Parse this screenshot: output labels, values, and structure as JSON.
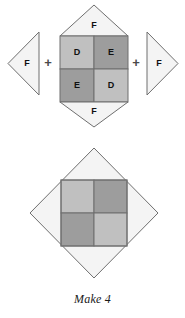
{
  "figure": {
    "caption": "Make 4",
    "background_color": "#ffffff",
    "outline_color": "#6f6f6f"
  },
  "colors": {
    "piece_f_fill": "#f4f4f4",
    "piece_d_fill": "#c0c0c0",
    "piece_e_fill": "#9d9d9d",
    "label_text": "#111111",
    "plus_text": "#4a4a4a"
  },
  "equation": {
    "operators": [
      {
        "symbol": "+",
        "name": "plus-left"
      },
      {
        "symbol": "+",
        "name": "plus-right"
      }
    ],
    "terms": [
      {
        "name": "left-triangle",
        "shape": "triangle-pointing-left",
        "piece": "F",
        "label": "F",
        "fill": "#f4f4f4"
      },
      {
        "name": "center-unit",
        "shape": "square-with-top-and-bottom-triangles",
        "pieces": [
          {
            "position": "top",
            "label": "F",
            "piece": "F",
            "fill": "#f4f4f4"
          },
          {
            "position": "top-left",
            "label": "D",
            "piece": "D",
            "fill": "#c0c0c0"
          },
          {
            "position": "top-right",
            "label": "E",
            "piece": "E",
            "fill": "#9d9d9d"
          },
          {
            "position": "bottom-left",
            "label": "E",
            "piece": "E",
            "fill": "#9d9d9d"
          },
          {
            "position": "bottom-right",
            "label": "D",
            "piece": "D",
            "fill": "#c0c0c0"
          },
          {
            "position": "bottom",
            "label": "F",
            "piece": "F",
            "fill": "#f4f4f4"
          }
        ]
      },
      {
        "name": "right-triangle",
        "shape": "triangle-pointing-right",
        "piece": "F",
        "label": "F",
        "fill": "#f4f4f4"
      }
    ]
  },
  "result": {
    "name": "assembled-block",
    "shape": "diamond-on-point-with-inner-four-patch",
    "outer": {
      "piece": "F",
      "fill": "#f4f4f4"
    },
    "inner_quadrants": [
      {
        "position": "top-left",
        "piece": "D",
        "fill": "#c0c0c0"
      },
      {
        "position": "top-right",
        "piece": "E",
        "fill": "#9d9d9d"
      },
      {
        "position": "bottom-left",
        "piece": "E",
        "fill": "#9d9d9d"
      },
      {
        "position": "bottom-right",
        "piece": "D",
        "fill": "#c0c0c0"
      }
    ]
  }
}
